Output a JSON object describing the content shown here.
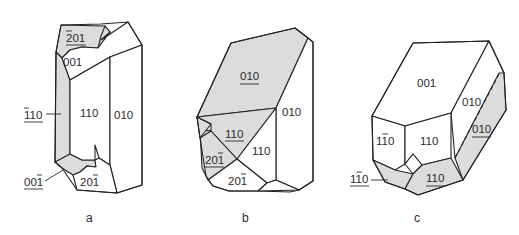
{
  "figure": {
    "colors": {
      "shaded_face": "#dcdcdc",
      "edge": "#222222",
      "background": "#ffffff"
    },
    "panels": [
      {
        "caption": "a",
        "faces": [
          {
            "id": "a-201bar-top",
            "label": "201",
            "overbar": "2",
            "underlined": true,
            "shaded": true
          },
          {
            "id": "a-001",
            "label": "001",
            "overbar": "",
            "underlined": false,
            "shaded": false
          },
          {
            "id": "a-1bar10",
            "label": "110",
            "overbar": "1",
            "underlined": true,
            "shaded": true
          },
          {
            "id": "a-110",
            "label": "110",
            "overbar": "",
            "underlined": false,
            "shaded": false
          },
          {
            "id": "a-010",
            "label": "010",
            "overbar": "",
            "underlined": false,
            "shaded": false
          },
          {
            "id": "a-001bar",
            "label": "001",
            "overbar": "last",
            "underlined": true,
            "shaded": true
          },
          {
            "id": "a-201bar",
            "label": "201",
            "overbar": "last",
            "underlined": false,
            "shaded": false
          }
        ]
      },
      {
        "caption": "b",
        "faces": [
          {
            "id": "b-010-under",
            "label": "010",
            "overbar": "",
            "underlined": true,
            "shaded": true
          },
          {
            "id": "b-010",
            "label": "010",
            "overbar": "",
            "underlined": false,
            "shaded": false
          },
          {
            "id": "b-110-under",
            "label": "110",
            "overbar": "",
            "underlined": true,
            "shaded": true
          },
          {
            "id": "b-110",
            "label": "110",
            "overbar": "",
            "underlined": false,
            "shaded": false
          },
          {
            "id": "b-201bar-under",
            "label": "201",
            "overbar": "last",
            "underlined": true,
            "shaded": true
          },
          {
            "id": "b-201bar",
            "label": "201",
            "overbar": "last",
            "underlined": false,
            "shaded": false
          }
        ]
      },
      {
        "caption": "c",
        "faces": [
          {
            "id": "c-001",
            "label": "001",
            "overbar": "",
            "underlined": false,
            "shaded": false
          },
          {
            "id": "c-010",
            "label": "010",
            "overbar": "",
            "underlined": false,
            "shaded": false
          },
          {
            "id": "c-010-under",
            "label": "010",
            "overbar": "",
            "underlined": true,
            "shaded": true
          },
          {
            "id": "c-1bar10",
            "label": "110",
            "overbar": "middle",
            "underlined": false,
            "shaded": false
          },
          {
            "id": "c-110",
            "label": "110",
            "overbar": "",
            "underlined": false,
            "shaded": false
          },
          {
            "id": "c-1bar10-under",
            "label": "110",
            "overbar": "middle",
            "underlined": true,
            "shaded": true
          },
          {
            "id": "c-110-under",
            "label": "110",
            "overbar": "",
            "underlined": true,
            "shaded": true
          }
        ]
      }
    ]
  }
}
